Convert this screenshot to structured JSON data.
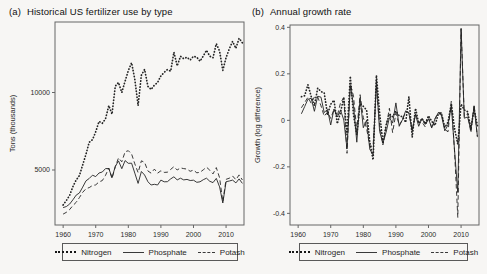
{
  "colors": {
    "background": "#f7f6f4",
    "axis": "#666666",
    "text": "#2a2a2a",
    "line": "#242424"
  },
  "chart_data": [
    {
      "id": "a",
      "type": "line",
      "tag": "(a)",
      "title": "Historical US fertilizer use by type",
      "xlabel": "",
      "ylabel": "Tons (thousands)",
      "xlim": [
        1957.5,
        2015.5
      ],
      "ylim": [
        1450,
        14550
      ],
      "xticks": [
        1960,
        1970,
        1980,
        1990,
        2000,
        2010
      ],
      "xtick_labels": [
        "1960",
        "1970",
        "1980",
        "1990",
        "2000",
        "2010"
      ],
      "yticks": [
        5000,
        10000
      ],
      "ytick_labels": [
        "5000",
        "10000"
      ],
      "grid": false,
      "legend_position": "bottom-boxed",
      "x": [
        1960,
        1961,
        1962,
        1963,
        1964,
        1965,
        1966,
        1967,
        1968,
        1969,
        1970,
        1971,
        1972,
        1973,
        1974,
        1975,
        1976,
        1977,
        1978,
        1979,
        1980,
        1981,
        1982,
        1983,
        1984,
        1985,
        1986,
        1987,
        1988,
        1989,
        1990,
        1991,
        1992,
        1993,
        1994,
        1995,
        1996,
        1997,
        1998,
        1999,
        2000,
        2001,
        2002,
        2003,
        2004,
        2005,
        2006,
        2007,
        2008,
        2009,
        2010,
        2011,
        2012,
        2013,
        2014,
        2015
      ],
      "series": [
        {
          "name": "Nitrogen",
          "style": "dotted",
          "values": [
            2738,
            3031,
            3370,
            3929,
            4353,
            4639,
            5326,
            6026,
            6788,
            6958,
            7459,
            8134,
            8016,
            8295,
            9157,
            8608,
            10407,
            10647,
            10002,
            10738,
            11407,
            11923,
            10854,
            9158,
            11114,
            11491,
            10398,
            10192,
            10480,
            10643,
            11076,
            11296,
            11476,
            11376,
            12599,
            11714,
            12339,
            12183,
            12280,
            12097,
            12335,
            12280,
            12018,
            12357,
            12725,
            12343,
            12243,
            13150,
            12668,
            11433,
            12259,
            12815,
            13300,
            12850,
            13500,
            13200
          ]
        },
        {
          "name": "Phosphate",
          "style": "solid",
          "values": [
            2572,
            2645,
            2807,
            3073,
            3378,
            3512,
            3897,
            4305,
            4452,
            4666,
            4574,
            4803,
            4873,
            5092,
            5099,
            4511,
            5232,
            5587,
            5085,
            5607,
            5432,
            5435,
            4797,
            4136,
            4904,
            4679,
            4242,
            4029,
            4079,
            4031,
            4345,
            4236,
            4246,
            4424,
            4562,
            4360,
            4470,
            4358,
            4395,
            4319,
            4344,
            4208,
            4235,
            4376,
            4467,
            4269,
            4186,
            4460,
            3910,
            2867,
            4247,
            4287,
            4350,
            4170,
            4426,
            4134
          ]
        },
        {
          "name": "Potash",
          "style": "dashed",
          "values": [
            2153,
            2272,
            2452,
            2707,
            2913,
            3221,
            3563,
            3793,
            3862,
            4001,
            4035,
            4231,
            4315,
            4649,
            5130,
            4453,
            5209,
            5780,
            5530,
            6175,
            6245,
            6030,
            5399,
            4831,
            5595,
            5488,
            4935,
            4800,
            5055,
            4796,
            4945,
            4844,
            4856,
            5035,
            5210,
            5000,
            5138,
            5091,
            5056,
            4916,
            4990,
            4818,
            4850,
            5015,
            5182,
            4985,
            4745,
            5156,
            4494,
            2961,
            4399,
            4472,
            4610,
            4372,
            4683,
            4357
          ]
        }
      ]
    },
    {
      "id": "b",
      "type": "line",
      "tag": "(b)",
      "title": "Annual growth rate",
      "xlabel": "",
      "ylabel": "Growth (log difference)",
      "xlim": [
        1957.5,
        2015.5
      ],
      "ylim": [
        -0.45,
        0.41
      ],
      "xticks": [
        1960,
        1970,
        1980,
        1990,
        2000,
        2010
      ],
      "xtick_labels": [
        "1960",
        "1970",
        "1980",
        "1990",
        "2000",
        "2010"
      ],
      "yticks": [
        -0.4,
        -0.2,
        0,
        0.2,
        0.4
      ],
      "ytick_labels": [
        "-0.4",
        "-0.2",
        "0",
        "0.2",
        "0.4"
      ],
      "grid": false,
      "legend_position": "bottom-boxed",
      "derivation": "values are year-over-year log differences ln(x_t / x_t-1) of the level series in panel (a), plotted for 1961-2015",
      "series": [
        {
          "name": "Nitrogen",
          "style": "dotted",
          "derive": {
            "chart": 0,
            "series": 0,
            "transform": "log_diff"
          }
        },
        {
          "name": "Phosphate",
          "style": "solid",
          "derive": {
            "chart": 0,
            "series": 1,
            "transform": "log_diff"
          }
        },
        {
          "name": "Potash",
          "style": "dashed",
          "derive": {
            "chart": 0,
            "series": 2,
            "transform": "log_diff"
          }
        }
      ]
    }
  ]
}
